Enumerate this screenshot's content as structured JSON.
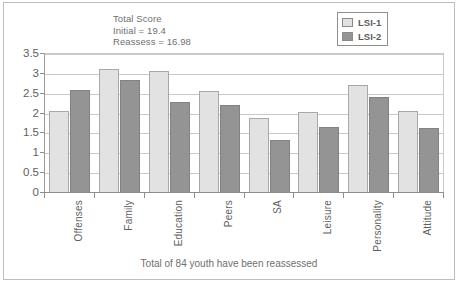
{
  "chart_data": {
    "type": "bar",
    "title": "",
    "xlabel": "",
    "ylabel": "",
    "ylim": [
      0,
      3.5
    ],
    "yticks": [
      "0",
      "0.5",
      "1",
      "1.5",
      "2",
      "2.5",
      "3",
      "3.5"
    ],
    "grid": true,
    "legend_position": "top-right",
    "categories": [
      "Offenses",
      "Family",
      "Education",
      "Peers",
      "SA",
      "Leisure",
      "Personality",
      "Attitude"
    ],
    "series": [
      {
        "name": "LSI-1",
        "color": "#e2e2e2",
        "values": [
          2.07,
          3.12,
          3.07,
          2.57,
          1.89,
          2.05,
          2.71,
          2.07
        ]
      },
      {
        "name": "LSI-2",
        "color": "#949494",
        "values": [
          2.59,
          2.85,
          2.3,
          2.21,
          1.34,
          1.67,
          2.41,
          1.64
        ]
      }
    ],
    "annotations": [
      "Total Score",
      "Initial = 19.4",
      "Reassess = 16.98"
    ],
    "caption": "Total of 84 youth have been reassessed"
  },
  "colors": {
    "series1": "#e2e2e2",
    "series2": "#949494",
    "grid": "#c9c9c9",
    "axis": "#8e8e8e",
    "text": "#5f5f5f",
    "frame": "#bdbdbd"
  }
}
